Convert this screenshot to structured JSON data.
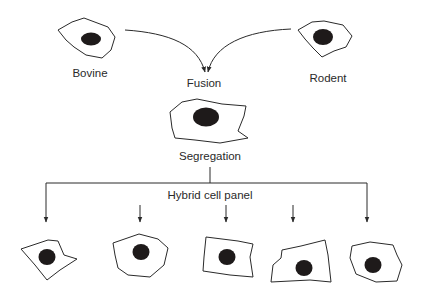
{
  "diagram": {
    "title_nodes": {
      "bovine": "Bovine",
      "rodent": "Rodent",
      "fusion": "Fusion",
      "segregation": "Segregation",
      "panel": "Hybrid cell panel"
    },
    "panel_cell_count": 5,
    "colors": {
      "stroke": "#2a2a2a",
      "nucleus": "#1e1a1a",
      "background": "#ffffff"
    }
  }
}
